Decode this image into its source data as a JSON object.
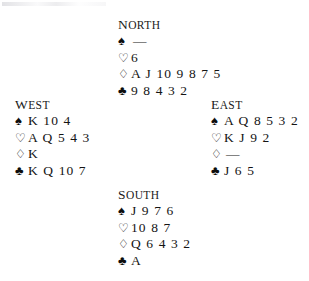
{
  "diagram": {
    "suit_symbols": {
      "spade": "♠",
      "heart": "♡",
      "diamond": "♢",
      "club": "♣"
    },
    "void_mark": "—"
  },
  "hands": {
    "north": {
      "label_first": "N",
      "label_rest": "ORTH",
      "spades": "—",
      "hearts": "6",
      "diamonds": "A J 10 9 8 7 5",
      "clubs": "9 8 4 3 2"
    },
    "west": {
      "label_first": "W",
      "label_rest": "EST",
      "spades": "K 10 4",
      "hearts": "A Q 5 4 3",
      "diamonds": "K",
      "clubs": "K Q 10 7"
    },
    "east": {
      "label_first": "E",
      "label_rest": "AST",
      "spades": "A Q 8 5 3 2",
      "hearts": "K J 9 2",
      "diamonds": "—",
      "clubs": "J 6 5"
    },
    "south": {
      "label_first": "S",
      "label_rest": "OUTH",
      "spades": "J 9 7 6",
      "hearts": "10 8 7",
      "diamonds": "Q 6 4 3 2",
      "clubs": "A"
    }
  }
}
